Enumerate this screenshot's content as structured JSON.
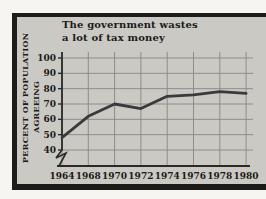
{
  "page": {
    "background": "#f6f5f1",
    "frame_color": "#1d1c1a",
    "panel_bg": "#cbc9c4",
    "text_color": "#1b1a18"
  },
  "chart_data": {
    "type": "line",
    "title_lines": [
      "The government wastes",
      "a lot of tax money"
    ],
    "ylabel_lines": [
      "PERCENT OF POPULATION",
      "AGREEING"
    ],
    "categories": [
      "1964",
      "1968",
      "1970",
      "1972",
      "1974",
      "1976",
      "1978",
      "1980"
    ],
    "values": [
      48,
      62,
      70,
      67,
      75,
      76,
      78,
      77
    ],
    "yticks": [
      100,
      90,
      80,
      70,
      60,
      50,
      40
    ],
    "ylim": [
      40,
      100
    ],
    "axis_break": true,
    "grid": true,
    "legend": "none",
    "colors": {
      "line": "#3a393b",
      "grid": "#8f8d89",
      "axis": "#2b2a28"
    }
  }
}
